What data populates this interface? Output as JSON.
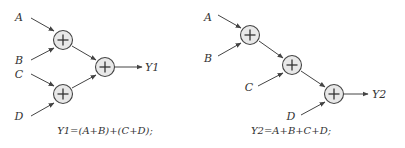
{
  "diagrams": [
    {
      "id": "tree",
      "inputs": [
        {
          "label": "A",
          "x": 19,
          "y": 21
        },
        {
          "label": "B",
          "x": 19,
          "y": 64
        },
        {
          "label": "C",
          "x": 19,
          "y": 78
        },
        {
          "label": "D",
          "x": 19,
          "y": 120
        }
      ],
      "adders": [
        {
          "x": 63,
          "y": 40
        },
        {
          "x": 63,
          "y": 94
        },
        {
          "x": 105,
          "y": 67
        }
      ],
      "edges": [
        {
          "x1": 31,
          "y1": 18,
          "x2": 54,
          "y2": 31
        },
        {
          "x1": 31,
          "y1": 60,
          "x2": 54,
          "y2": 48
        },
        {
          "x1": 31,
          "y1": 74,
          "x2": 54,
          "y2": 86
        },
        {
          "x1": 31,
          "y1": 116,
          "x2": 54,
          "y2": 103
        },
        {
          "x1": 72,
          "y1": 46,
          "x2": 96,
          "y2": 60
        },
        {
          "x1": 72,
          "y1": 88,
          "x2": 96,
          "y2": 75
        },
        {
          "x1": 115,
          "y1": 67,
          "x2": 142,
          "y2": 67
        }
      ],
      "output": {
        "label": "Y1",
        "x": 145,
        "y": 71
      },
      "caption": {
        "text": "Y1=(A+B)+(C+D);",
        "x": 105,
        "y": 134
      }
    },
    {
      "id": "chain",
      "inputs": [
        {
          "label": "A",
          "x": 208,
          "y": 21
        },
        {
          "label": "B",
          "x": 208,
          "y": 62
        },
        {
          "label": "C",
          "x": 249,
          "y": 91
        },
        {
          "label": "D",
          "x": 291,
          "y": 120
        }
      ],
      "adders": [
        {
          "x": 250,
          "y": 35
        },
        {
          "x": 292,
          "y": 65
        },
        {
          "x": 334,
          "y": 94
        }
      ],
      "edges": [
        {
          "x1": 218,
          "y1": 15,
          "x2": 241,
          "y2": 28
        },
        {
          "x1": 218,
          "y1": 56,
          "x2": 241,
          "y2": 43
        },
        {
          "x1": 259,
          "y1": 41,
          "x2": 283,
          "y2": 58
        },
        {
          "x1": 258,
          "y1": 86,
          "x2": 283,
          "y2": 73
        },
        {
          "x1": 301,
          "y1": 71,
          "x2": 325,
          "y2": 87
        },
        {
          "x1": 301,
          "y1": 115,
          "x2": 325,
          "y2": 102
        },
        {
          "x1": 344,
          "y1": 94,
          "x2": 368,
          "y2": 94
        }
      ],
      "output": {
        "label": "Y2",
        "x": 372,
        "y": 98
      },
      "caption": {
        "text": "Y2=A+B+C+D;",
        "x": 291,
        "y": 134
      }
    }
  ],
  "style": {
    "node_fill": "#e8e8e8",
    "stroke": "#444444",
    "text": "#333333"
  }
}
